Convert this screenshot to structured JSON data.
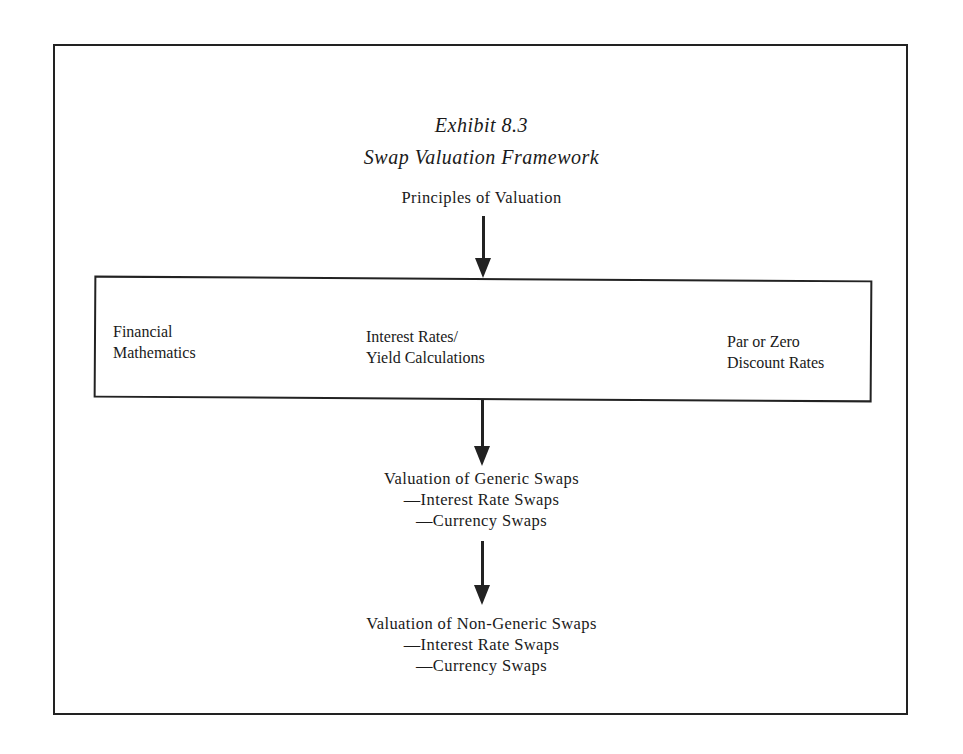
{
  "exhibit": {
    "number": "Exhibit 8.3",
    "title": "Swap Valuation Framework"
  },
  "nodes": {
    "principles": "Principles of Valuation",
    "foundations": [
      {
        "line1": "Financial",
        "line2": "Mathematics"
      },
      {
        "line1": "Interest Rates/",
        "line2": "Yield Calculations"
      },
      {
        "line1": "Par or Zero",
        "line2": "Discount Rates"
      }
    ],
    "generic": {
      "heading": "Valuation of Generic Swaps",
      "items": [
        "—Interest Rate Swaps",
        "—Currency Swaps"
      ]
    },
    "non_generic": {
      "heading": "Valuation of Non-Generic Swaps",
      "items": [
        "—Interest Rate Swaps",
        "—Currency Swaps"
      ]
    }
  },
  "edges": [
    {
      "from": "principles",
      "to": "foundations"
    },
    {
      "from": "foundations",
      "to": "generic"
    },
    {
      "from": "generic",
      "to": "non_generic"
    }
  ]
}
